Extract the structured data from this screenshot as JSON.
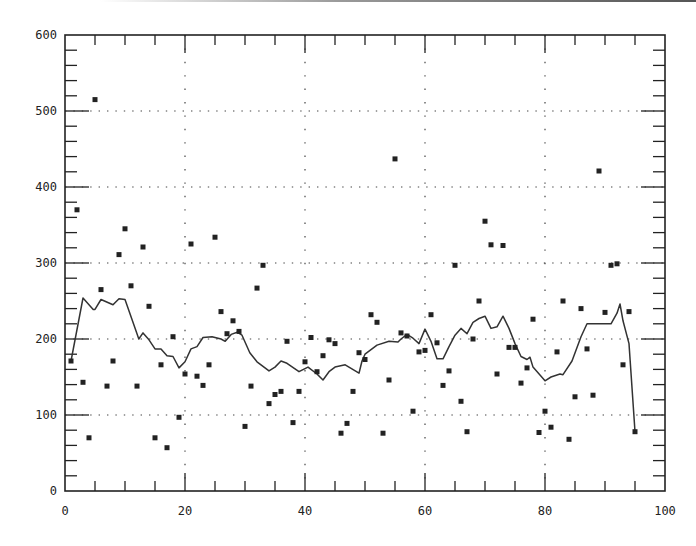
{
  "chart_data": {
    "type": "scatter",
    "title": "",
    "xlabel": "",
    "ylabel": "",
    "xlim": [
      0,
      100
    ],
    "ylim": [
      0,
      600
    ],
    "grid": "dotted, major ticks",
    "legend": null,
    "x_ticks": [
      "0",
      "20",
      "40",
      "60",
      "80",
      "100"
    ],
    "y_ticks": [
      "0",
      "100",
      "200",
      "300",
      "400",
      "500",
      "600"
    ],
    "series": [
      {
        "name": "observations",
        "kind": "scatter",
        "marker": "square",
        "points": [
          [
            1,
            171
          ],
          [
            2,
            370
          ],
          [
            3,
            143
          ],
          [
            4,
            70
          ],
          [
            5,
            515
          ],
          [
            6,
            265
          ],
          [
            7,
            138
          ],
          [
            8,
            171
          ],
          [
            9,
            311
          ],
          [
            10,
            345
          ],
          [
            11,
            270
          ],
          [
            12,
            138
          ],
          [
            13,
            321
          ],
          [
            14,
            243
          ],
          [
            15,
            70
          ],
          [
            16,
            166
          ],
          [
            17,
            57
          ],
          [
            18,
            203
          ],
          [
            19,
            97
          ],
          [
            20,
            154
          ],
          [
            21,
            325
          ],
          [
            22,
            151
          ],
          [
            23,
            139
          ],
          [
            24,
            166
          ],
          [
            25,
            334
          ],
          [
            26,
            236
          ],
          [
            27,
            207
          ],
          [
            28,
            224
          ],
          [
            29,
            210
          ],
          [
            30,
            85
          ],
          [
            31,
            138
          ],
          [
            32,
            267
          ],
          [
            33,
            297
          ],
          [
            34,
            115
          ],
          [
            35,
            127
          ],
          [
            36,
            131
          ],
          [
            37,
            197
          ],
          [
            38,
            90
          ],
          [
            39,
            131
          ],
          [
            40,
            170
          ],
          [
            41,
            202
          ],
          [
            42,
            157
          ],
          [
            43,
            178
          ],
          [
            44,
            199
          ],
          [
            45,
            194
          ],
          [
            46,
            76
          ],
          [
            47,
            89
          ],
          [
            48,
            131
          ],
          [
            49,
            182
          ],
          [
            50,
            173
          ],
          [
            51,
            232
          ],
          [
            52,
            222
          ],
          [
            53,
            76
          ],
          [
            54,
            146
          ],
          [
            55,
            437
          ],
          [
            56,
            208
          ],
          [
            57,
            204
          ],
          [
            58,
            105
          ],
          [
            59,
            183
          ],
          [
            60,
            185
          ],
          [
            61,
            232
          ],
          [
            62,
            195
          ],
          [
            63,
            139
          ],
          [
            64,
            158
          ],
          [
            65,
            297
          ],
          [
            66,
            118
          ],
          [
            67,
            78
          ],
          [
            68,
            200
          ],
          [
            69,
            250
          ],
          [
            70,
            355
          ],
          [
            71,
            324
          ],
          [
            72,
            154
          ],
          [
            73,
            323
          ],
          [
            74,
            189
          ],
          [
            75,
            189
          ],
          [
            76,
            142
          ],
          [
            77,
            162
          ],
          [
            78,
            226
          ],
          [
            79,
            77
          ],
          [
            80,
            105
          ],
          [
            81,
            84
          ],
          [
            82,
            183
          ],
          [
            83,
            250
          ],
          [
            84,
            68
          ],
          [
            85,
            124
          ],
          [
            86,
            240
          ],
          [
            87,
            187
          ],
          [
            88,
            126
          ],
          [
            89,
            421
          ],
          [
            90,
            235
          ],
          [
            91,
            297
          ],
          [
            92,
            299
          ],
          [
            93,
            166
          ],
          [
            94,
            236
          ],
          [
            95,
            78
          ]
        ]
      },
      {
        "name": "moving average",
        "kind": "line",
        "points": [
          [
            1,
            171
          ],
          [
            3,
            254
          ],
          [
            4.7,
            239
          ],
          [
            5,
            239
          ],
          [
            6,
            252
          ],
          [
            8,
            245
          ],
          [
            9,
            253
          ],
          [
            10,
            252
          ],
          [
            12,
            207
          ],
          [
            12.3,
            200
          ],
          [
            13,
            208
          ],
          [
            14,
            199
          ],
          [
            15,
            187
          ],
          [
            16,
            187
          ],
          [
            17,
            178
          ],
          [
            18,
            177
          ],
          [
            19,
            162
          ],
          [
            20,
            170
          ],
          [
            21,
            187
          ],
          [
            22,
            190
          ],
          [
            23,
            202
          ],
          [
            24.5,
            203
          ],
          [
            26,
            200
          ],
          [
            26.7,
            197
          ],
          [
            27.7,
            206
          ],
          [
            28.7,
            209
          ],
          [
            29.5,
            205
          ],
          [
            30.8,
            182
          ],
          [
            32,
            170
          ],
          [
            34,
            158
          ],
          [
            35,
            163
          ],
          [
            36,
            171
          ],
          [
            37,
            168
          ],
          [
            39,
            157
          ],
          [
            40,
            161
          ],
          [
            40.5,
            163
          ],
          [
            42,
            154
          ],
          [
            43,
            146
          ],
          [
            44,
            157
          ],
          [
            45,
            163
          ],
          [
            46.7,
            166
          ],
          [
            49,
            155
          ],
          [
            49.5,
            171
          ],
          [
            50,
            180
          ],
          [
            52,
            192
          ],
          [
            54,
            197
          ],
          [
            55.5,
            196
          ],
          [
            56,
            200
          ],
          [
            57,
            206
          ],
          [
            58,
            201
          ],
          [
            59,
            194
          ],
          [
            60,
            213
          ],
          [
            61,
            197
          ],
          [
            62,
            174
          ],
          [
            63,
            174
          ],
          [
            64,
            190
          ],
          [
            65,
            205
          ],
          [
            66,
            214
          ],
          [
            67,
            207
          ],
          [
            68,
            222
          ],
          [
            69,
            227
          ],
          [
            70,
            230
          ],
          [
            71,
            214
          ],
          [
            72,
            216
          ],
          [
            73,
            230
          ],
          [
            74,
            214
          ],
          [
            75,
            194
          ],
          [
            76,
            177
          ],
          [
            77,
            173
          ],
          [
            77.5,
            176
          ],
          [
            78,
            163
          ],
          [
            80,
            145
          ],
          [
            81,
            150
          ],
          [
            82.5,
            154
          ],
          [
            83,
            153
          ],
          [
            84.5,
            171
          ],
          [
            86,
            203
          ],
          [
            87,
            220
          ],
          [
            88,
            220
          ],
          [
            91,
            220
          ],
          [
            92,
            234
          ],
          [
            92.5,
            246
          ],
          [
            93,
            224
          ],
          [
            94,
            194
          ],
          [
            95,
            78
          ]
        ]
      }
    ]
  }
}
